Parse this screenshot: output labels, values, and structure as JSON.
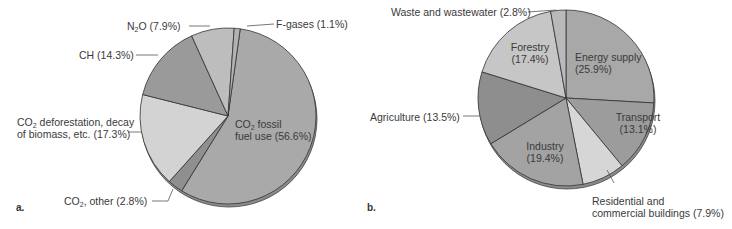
{
  "chart_data": [
    {
      "type": "pie",
      "panel": "a.",
      "title": "",
      "slices": [
        {
          "label": "CO2 fossil fuel use",
          "value": 56.6,
          "color": "#a9a9a9"
        },
        {
          "label": "CO2, other",
          "value": 2.8,
          "color": "#8f8f8f"
        },
        {
          "label": "CO2 deforestation, decay of biomass, etc.",
          "value": 17.3,
          "color": "#d3d3d3"
        },
        {
          "label": "CH",
          "value": 14.3,
          "color": "#9a9a9a"
        },
        {
          "label": "N2O",
          "value": 7.9,
          "color": "#bdbdbd"
        },
        {
          "label": "F-gases",
          "value": 1.1,
          "color": "#b2b2b2"
        }
      ]
    },
    {
      "type": "pie",
      "panel": "b.",
      "title": "",
      "slices": [
        {
          "label": "Energy supply",
          "value": 25.9,
          "color": "#a8a8a8"
        },
        {
          "label": "Transport",
          "value": 13.1,
          "color": "#9c9c9c"
        },
        {
          "label": "Residential and commercial buildings",
          "value": 7.9,
          "color": "#d6d6d6"
        },
        {
          "label": "Industry",
          "value": 19.4,
          "color": "#a3a3a3"
        },
        {
          "label": "Agriculture",
          "value": 13.5,
          "color": "#8e8e8e"
        },
        {
          "label": "Forestry",
          "value": 17.4,
          "color": "#c6c6c6"
        },
        {
          "label": "Waste and wastewater",
          "value": 2.8,
          "color": "#b9b9b9"
        }
      ]
    }
  ],
  "labels": {
    "a": {
      "panel": "a.",
      "n2o": "(7.9%)",
      "fgases": "F-gases (1.1%)",
      "ch": "CH (14.3%)",
      "defor1": "deforestation, decay",
      "defor2": "of biomass, etc. (17.3%)",
      "fossil1": "fossil",
      "fossil2": "fuel use (56.6%)",
      "other": ", other (2.8%)"
    },
    "b": {
      "panel": "b.",
      "waste": "Waste and wastewater (2.8%)",
      "forestry1": "Forestry",
      "forestry2": "(17.4%)",
      "energy1": "Energy supply",
      "energy2": "(25.9%)",
      "agri": "Agriculture (13.5%)",
      "transport1": "Transport",
      "transport2": "(13.1%)",
      "industry1": "Industry",
      "industry2": "(19.4%)",
      "res1": "Residential and",
      "res2": "commercial buildings (7.9%)"
    }
  }
}
